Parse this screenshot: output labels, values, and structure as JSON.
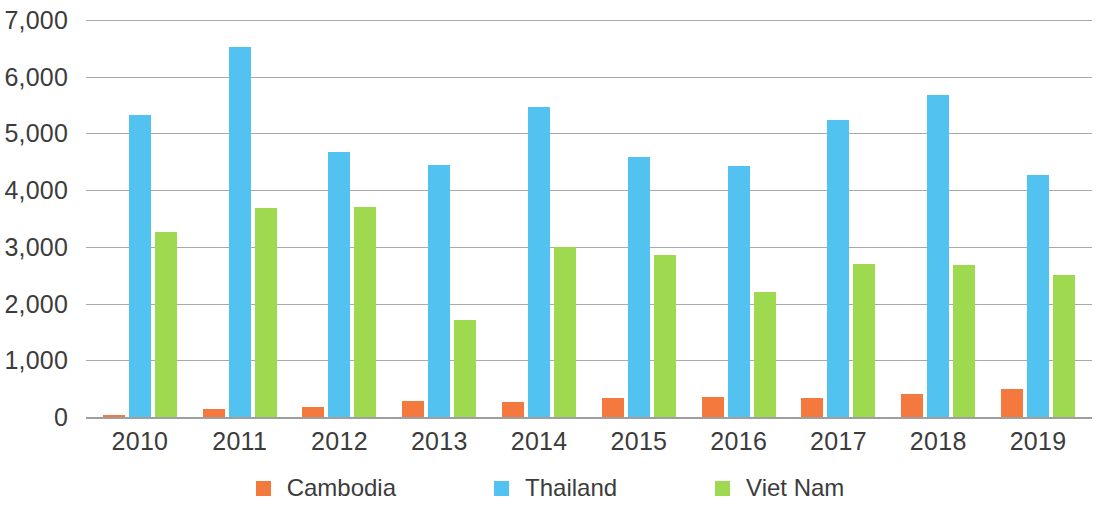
{
  "chart_data": {
    "type": "bar",
    "title": "",
    "subtitle": "",
    "xlabel": "",
    "ylabel": "",
    "categories": [
      "2010",
      "2011",
      "2012",
      "2013",
      "2014",
      "2015",
      "2016",
      "2017",
      "2018",
      "2019"
    ],
    "series": [
      {
        "name": "Cambodia",
        "color": "#f4793e",
        "values": [
          40,
          140,
          170,
          290,
          260,
          330,
          350,
          340,
          410,
          490
        ]
      },
      {
        "name": "Thailand",
        "color": "#52c3f0",
        "values": [
          5320,
          6530,
          4670,
          4450,
          5470,
          4590,
          4430,
          5230,
          5680,
          4270
        ]
      },
      {
        "name": "Viet Nam",
        "color": "#9ed94f",
        "values": [
          3270,
          3680,
          3700,
          1710,
          2990,
          2860,
          2210,
          2690,
          2680,
          2500
        ]
      }
    ],
    "ylim": [
      0,
      7000
    ],
    "y_ticks": [
      0,
      1000,
      2000,
      3000,
      4000,
      5000,
      6000,
      7000
    ],
    "y_tick_labels": [
      "0",
      "1,000",
      "2,000",
      "3,000",
      "4,000",
      "5,000",
      "6,000",
      "7,000"
    ],
    "grid": true,
    "legend_position": "bottom",
    "legend": [
      "Cambodia",
      "Thailand",
      "Viet Nam"
    ]
  }
}
